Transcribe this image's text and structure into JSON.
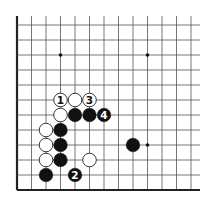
{
  "diagram": {
    "type": "go-board-fragment",
    "grid": {
      "columns": 13,
      "rows": 12,
      "origin_x": 17,
      "origin_y": 25,
      "spacing_x": 14.5,
      "spacing_y": 15,
      "top_cut_y": 16,
      "right_cut_x": 200,
      "left_edge": true,
      "bottom_edge": true,
      "line_color": "#555555",
      "edge_color": "#222222"
    },
    "star_points": [
      {
        "col": 3,
        "row": 2
      },
      {
        "col": 9,
        "row": 2
      },
      {
        "col": 9,
        "row": 8
      }
    ],
    "stones": [
      {
        "col": 3,
        "row": 5,
        "color": "white",
        "label": "1"
      },
      {
        "col": 4,
        "row": 5,
        "color": "white",
        "label": ""
      },
      {
        "col": 5,
        "row": 5,
        "color": "white",
        "label": "3"
      },
      {
        "col": 3,
        "row": 6,
        "color": "white",
        "label": ""
      },
      {
        "col": 4,
        "row": 6,
        "color": "black",
        "label": ""
      },
      {
        "col": 5,
        "row": 6,
        "color": "black",
        "label": ""
      },
      {
        "col": 6,
        "row": 6,
        "color": "black",
        "label": "4"
      },
      {
        "col": 2,
        "row": 7,
        "color": "white",
        "label": ""
      },
      {
        "col": 3,
        "row": 7,
        "color": "black",
        "label": ""
      },
      {
        "col": 2,
        "row": 8,
        "color": "white",
        "label": ""
      },
      {
        "col": 3,
        "row": 8,
        "color": "black",
        "label": ""
      },
      {
        "col": 8,
        "row": 8,
        "color": "black",
        "label": ""
      },
      {
        "col": 2,
        "row": 9,
        "color": "white",
        "label": ""
      },
      {
        "col": 3,
        "row": 9,
        "color": "black",
        "label": ""
      },
      {
        "col": 5,
        "row": 9,
        "color": "white",
        "label": ""
      },
      {
        "col": 2,
        "row": 10,
        "color": "black",
        "label": ""
      },
      {
        "col": 4,
        "row": 10,
        "color": "black",
        "label": "2"
      }
    ],
    "colors": {
      "black_stone": "#111111",
      "white_stone": "#ffffff",
      "white_stone_outline": "#222222",
      "label_on_black": "#ffffff",
      "label_on_white": "#111111"
    }
  }
}
